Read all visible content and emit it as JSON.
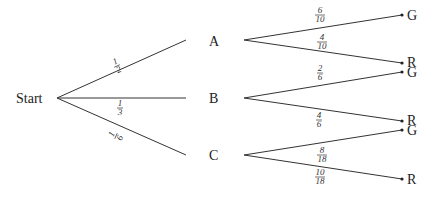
{
  "diagram": {
    "type": "probability-tree",
    "root": {
      "label": "Start"
    },
    "level1": [
      {
        "label": "A",
        "prob_num": "1",
        "prob_den": "2"
      },
      {
        "label": "B",
        "prob_num": "1",
        "prob_den": "3"
      },
      {
        "label": "C",
        "prob_num": "1",
        "prob_den": "6"
      }
    ],
    "level2": [
      {
        "parent": "A",
        "label": "G",
        "prob_num": "6",
        "prob_den": "10"
      },
      {
        "parent": "A",
        "label": "R",
        "prob_num": "4",
        "prob_den": "10"
      },
      {
        "parent": "B",
        "label": "G",
        "prob_num": "2",
        "prob_den": "6"
      },
      {
        "parent": "B",
        "label": "R",
        "prob_num": "4",
        "prob_den": "6"
      },
      {
        "parent": "C",
        "label": "G",
        "prob_num": "8",
        "prob_den": "18"
      },
      {
        "parent": "C",
        "label": "R",
        "prob_num": "10",
        "prob_den": "18"
      }
    ],
    "colors": {
      "line": "#333333",
      "text": "#222222",
      "background": "#ffffff"
    }
  }
}
